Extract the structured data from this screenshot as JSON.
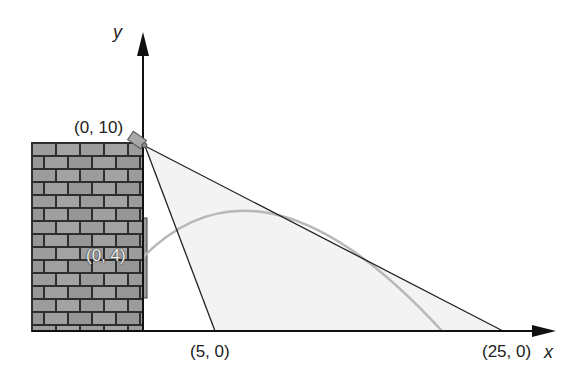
{
  "diagram": {
    "axes": {
      "x_label": "x",
      "y_label": "y"
    },
    "points": {
      "camera": "(0, 10)",
      "wall_point": "(0, 4)",
      "near_ground": "(5, 0)",
      "far_ground": "(25, 0)"
    },
    "colors": {
      "axis": "#111111",
      "line": "#222222",
      "parabola": "#b8b8b8",
      "shade": "#f3f3f3",
      "brick": "#9c9c9c",
      "mortar": "#2e2e2e"
    }
  }
}
